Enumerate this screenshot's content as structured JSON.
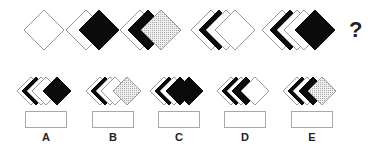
{
  "puzzle": {
    "question_mark": "?",
    "colors": {
      "white": "#ffffff",
      "black": "#0b0b0b",
      "dotted": "#d4d4d4",
      "outline": "#9a9a9a"
    },
    "sequence": [
      {
        "id": "fig-1",
        "cy": 30,
        "r": 20,
        "diamonds": [
          {
            "cx": 44,
            "fill": "white"
          }
        ]
      },
      {
        "id": "fig-2",
        "cy": 30,
        "r": 20,
        "diamonds": [
          {
            "cx": 86,
            "fill": "white"
          },
          {
            "cx": 99,
            "fill": "black"
          }
        ]
      },
      {
        "id": "fig-3",
        "cy": 30,
        "r": 20,
        "diamonds": [
          {
            "cx": 140,
            "fill": "white"
          },
          {
            "cx": 148,
            "fill": "black"
          },
          {
            "cx": 161,
            "fill": "dotted"
          }
        ]
      },
      {
        "id": "fig-4",
        "cy": 30,
        "r": 20,
        "diamonds": [
          {
            "cx": 211,
            "fill": "white"
          },
          {
            "cx": 219,
            "fill": "black"
          },
          {
            "cx": 226,
            "fill": "white"
          },
          {
            "cx": 235,
            "fill": "white"
          }
        ]
      },
      {
        "id": "fig-5",
        "cy": 30,
        "r": 20,
        "diamonds": [
          {
            "cx": 282,
            "fill": "white"
          },
          {
            "cx": 290,
            "fill": "black"
          },
          {
            "cx": 297,
            "fill": "white"
          },
          {
            "cx": 304,
            "fill": "white"
          },
          {
            "cx": 315,
            "fill": "black"
          }
        ]
      }
    ],
    "options": [
      {
        "label": "A",
        "box_x": 25,
        "cy": 91,
        "r": 14,
        "diamonds": [
          {
            "cx": 31,
            "fill": "white"
          },
          {
            "cx": 36,
            "fill": "black"
          },
          {
            "cx": 41,
            "fill": "white"
          },
          {
            "cx": 46,
            "fill": "white"
          },
          {
            "cx": 57,
            "fill": "black"
          }
        ]
      },
      {
        "label": "B",
        "box_x": 92,
        "cy": 91,
        "r": 14,
        "diamonds": [
          {
            "cx": 100,
            "fill": "white"
          },
          {
            "cx": 105,
            "fill": "black"
          },
          {
            "cx": 110,
            "fill": "white"
          },
          {
            "cx": 115,
            "fill": "white"
          },
          {
            "cx": 127,
            "fill": "dotted"
          }
        ]
      },
      {
        "label": "C",
        "box_x": 158,
        "cy": 91,
        "r": 14,
        "diamonds": [
          {
            "cx": 164,
            "fill": "white"
          },
          {
            "cx": 169,
            "fill": "black"
          },
          {
            "cx": 174,
            "fill": "white"
          },
          {
            "cx": 180,
            "fill": "black"
          },
          {
            "cx": 189,
            "fill": "black"
          }
        ]
      },
      {
        "label": "D",
        "box_x": 224,
        "cy": 91,
        "r": 14,
        "diamonds": [
          {
            "cx": 231,
            "fill": "white"
          },
          {
            "cx": 236,
            "fill": "black"
          },
          {
            "cx": 241,
            "fill": "white"
          },
          {
            "cx": 246,
            "fill": "black"
          },
          {
            "cx": 255,
            "fill": "white"
          }
        ]
      },
      {
        "label": "E",
        "box_x": 291,
        "cy": 91,
        "r": 14,
        "diamonds": [
          {
            "cx": 297,
            "fill": "white"
          },
          {
            "cx": 302,
            "fill": "black"
          },
          {
            "cx": 307,
            "fill": "white"
          },
          {
            "cx": 313,
            "fill": "black"
          },
          {
            "cx": 322,
            "fill": "dotted"
          }
        ]
      }
    ]
  }
}
